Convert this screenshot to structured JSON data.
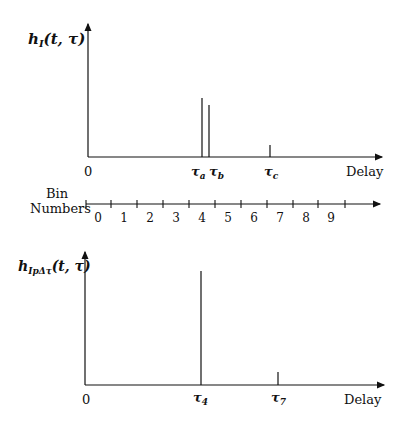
{
  "top_plot": {
    "ylabel_main": "h",
    "ylabel_sub": "I",
    "ylabel_args": "(t, τ)",
    "origin_label": "0",
    "xlabel": "Delay",
    "spikes": [
      {
        "label": "τ",
        "sub": "a",
        "x": 202,
        "top": 98
      },
      {
        "label": "τ",
        "sub": "b",
        "x": 209,
        "top": 105
      },
      {
        "label": "τ",
        "sub": "c",
        "x": 270,
        "top": 145
      }
    ]
  },
  "bin_axis": {
    "label_line1": "Bin",
    "label_line2": "Numbers",
    "bins": [
      "0",
      "1",
      "2",
      "3",
      "4",
      "5",
      "6",
      "7",
      "8",
      "9"
    ]
  },
  "bottom_plot": {
    "ylabel_main": "h",
    "ylabel_sub": "IpΔτ",
    "ylabel_args": "(t, τ)",
    "origin_label": "0",
    "xlabel": "Delay",
    "spikes": [
      {
        "label": "τ",
        "sub": "4",
        "x": 201,
        "top": 271
      },
      {
        "label": "τ",
        "sub": "7",
        "x": 278,
        "top": 372
      }
    ]
  }
}
